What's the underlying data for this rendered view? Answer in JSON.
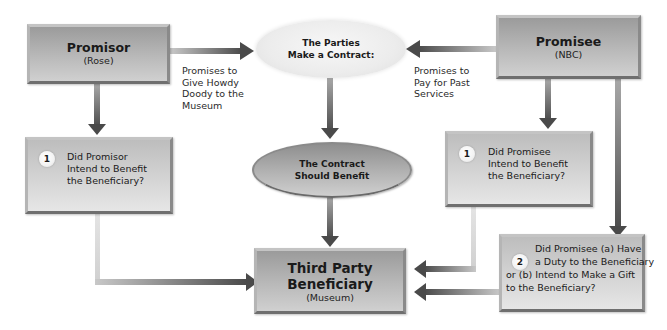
{
  "diagram": {
    "promisor": {
      "title": "Promisor",
      "subtitle": "(Rose)"
    },
    "promisee": {
      "title": "Promisee",
      "subtitle": "(NBC)"
    },
    "contract_ellipse": {
      "line1": "The Parties",
      "line2": "Make a Contract:"
    },
    "benefit_ellipse": {
      "line1": "The Contract",
      "line2": "Should Benefit"
    },
    "third_party": {
      "line1": "Third Party",
      "line2": "Beneficiary",
      "subtitle": "(Museum)"
    },
    "promisor_promise": {
      "line1": "Promises to",
      "line2": "Give Howdy",
      "line3": "Doody to the",
      "line4": "Museum"
    },
    "promisee_promise": {
      "line1": "Promises to",
      "line2": "Pay for Past",
      "line3": "Services"
    },
    "promisor_question": {
      "number": "1",
      "line1": "Did Promisor",
      "line2": "Intend to Benefit",
      "line3": "the Beneficiary?"
    },
    "promisee_question1": {
      "number": "1",
      "line1": "Did Promisee",
      "line2": "Intend to Benefit",
      "line3": "the Beneficiary?"
    },
    "promisee_question2": {
      "number": "2",
      "line1": "Did Promisee (a) Have",
      "line2": "a Duty to the Beneficiary",
      "line3": "or (b) Intend to Make a Gift",
      "line4": "to the Beneficiary?"
    },
    "colors": {
      "box_gray": "#b5b5b5",
      "box_border": "#8f8f8f",
      "arrow_dark": "#4a4a4a",
      "connector_light": "#cfcfcf",
      "ellipse_light": "#efefef"
    }
  }
}
